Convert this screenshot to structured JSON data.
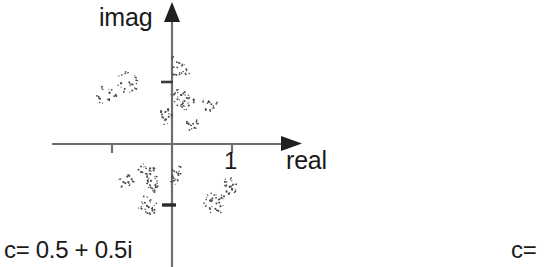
{
  "figure": {
    "title": "",
    "background_color": "#ffffff",
    "axis_color": "#6e6e6e",
    "point_color": "#4a4a4a",
    "text_color": "#1a1a1a"
  },
  "axes": {
    "x_axis_label": "real",
    "y_axis_label": "imag",
    "x_tick_labels": [
      "1"
    ],
    "origin_px": {
      "x": 172,
      "y": 144
    },
    "unit_px": 60,
    "x_ticks_value": [
      -1,
      1
    ],
    "y_ticks_value": [
      1,
      -1
    ],
    "x_range": [
      -2.0,
      2.0
    ],
    "y_range": [
      -2.0,
      2.4
    ]
  },
  "captions": {
    "left": "c= 0.5 + 0.5i",
    "right": "c="
  },
  "chart_data": {
    "type": "scatter",
    "title": "",
    "xlabel": "real",
    "ylabel": "imag",
    "xlim": [
      -2.0,
      2.0
    ],
    "ylim": [
      -2.0,
      2.4
    ],
    "grid": false,
    "legend": "none",
    "annotations": [
      "c= 0.5 + 0.5i",
      "c="
    ],
    "clusters": [
      {
        "name": "upper-left-outer",
        "center": [
          -1.07,
          0.85
        ],
        "n": 6
      },
      {
        "name": "upper-left-inner",
        "center": [
          -0.72,
          1.03
        ],
        "n": 11
      },
      {
        "name": "upper-right-top",
        "center": [
          0.12,
          1.25
        ],
        "n": 10
      },
      {
        "name": "upper-right-mid",
        "center": [
          0.18,
          0.72
        ],
        "n": 13
      },
      {
        "name": "upper-right-far",
        "center": [
          0.6,
          0.66
        ],
        "n": 6
      },
      {
        "name": "upper-axis-left",
        "center": [
          -0.1,
          0.5
        ],
        "n": 7
      },
      {
        "name": "upper-right-low",
        "center": [
          0.33,
          0.32
        ],
        "n": 6
      },
      {
        "name": "lower-left-upper",
        "center": [
          -0.42,
          -0.43
        ],
        "n": 7
      },
      {
        "name": "lower-left-mid",
        "center": [
          -0.78,
          -0.63
        ],
        "n": 6
      },
      {
        "name": "lower-left-inner",
        "center": [
          -0.32,
          -0.67
        ],
        "n": 11
      },
      {
        "name": "lower-axis-right",
        "center": [
          0.07,
          -0.53
        ],
        "n": 8
      },
      {
        "name": "lower-left-bottom",
        "center": [
          -0.4,
          -1.03
        ],
        "n": 10
      },
      {
        "name": "lower-right-main",
        "center": [
          0.72,
          -0.98
        ],
        "n": 13
      },
      {
        "name": "lower-right-upper",
        "center": [
          0.96,
          -0.72
        ],
        "n": 7
      }
    ],
    "points": [
      [
        -1.22,
        0.78
      ],
      [
        -1.14,
        0.92
      ],
      [
        -1.02,
        0.88
      ],
      [
        -1.06,
        0.74
      ],
      [
        -0.96,
        0.8
      ],
      [
        -1.18,
        0.66
      ],
      [
        -0.86,
        1.14
      ],
      [
        -0.76,
        1.18
      ],
      [
        -0.62,
        1.12
      ],
      [
        -0.82,
        1.02
      ],
      [
        -0.72,
        1.0
      ],
      [
        -0.66,
        0.96
      ],
      [
        -0.58,
        1.04
      ],
      [
        -0.78,
        0.9
      ],
      [
        -0.68,
        0.86
      ],
      [
        -0.88,
        0.96
      ],
      [
        -0.6,
        0.9
      ],
      [
        0.04,
        1.42
      ],
      [
        0.1,
        1.36
      ],
      [
        0.16,
        1.3
      ],
      [
        0.06,
        1.26
      ],
      [
        0.14,
        1.2
      ],
      [
        0.22,
        1.24
      ],
      [
        0.1,
        1.14
      ],
      [
        0.02,
        1.18
      ],
      [
        0.2,
        1.34
      ],
      [
        0.26,
        1.16
      ],
      [
        0.08,
        0.88
      ],
      [
        0.14,
        0.82
      ],
      [
        0.2,
        0.84
      ],
      [
        0.1,
        0.76
      ],
      [
        0.18,
        0.7
      ],
      [
        0.26,
        0.74
      ],
      [
        0.14,
        0.64
      ],
      [
        0.22,
        0.6
      ],
      [
        0.3,
        0.66
      ],
      [
        0.06,
        0.68
      ],
      [
        0.28,
        0.8
      ],
      [
        0.34,
        0.72
      ],
      [
        0.02,
        0.8
      ],
      [
        0.54,
        0.72
      ],
      [
        0.62,
        0.68
      ],
      [
        0.68,
        0.64
      ],
      [
        0.58,
        0.6
      ],
      [
        0.66,
        0.56
      ],
      [
        0.72,
        0.7
      ],
      [
        -0.16,
        0.56
      ],
      [
        -0.08,
        0.52
      ],
      [
        -0.02,
        0.46
      ],
      [
        -0.12,
        0.42
      ],
      [
        -0.18,
        0.48
      ],
      [
        -0.04,
        0.58
      ],
      [
        -0.1,
        0.36
      ],
      [
        0.26,
        0.36
      ],
      [
        0.34,
        0.32
      ],
      [
        0.4,
        0.28
      ],
      [
        0.3,
        0.24
      ],
      [
        0.38,
        0.38
      ],
      [
        0.44,
        0.34
      ],
      [
        -0.5,
        -0.36
      ],
      [
        -0.42,
        -0.4
      ],
      [
        -0.34,
        -0.44
      ],
      [
        -0.46,
        -0.48
      ],
      [
        -0.38,
        -0.52
      ],
      [
        -0.3,
        -0.38
      ],
      [
        -0.54,
        -0.44
      ],
      [
        -0.86,
        -0.58
      ],
      [
        -0.78,
        -0.62
      ],
      [
        -0.7,
        -0.66
      ],
      [
        -0.82,
        -0.7
      ],
      [
        -0.74,
        -0.54
      ],
      [
        -0.66,
        -0.6
      ],
      [
        -0.4,
        -0.6
      ],
      [
        -0.32,
        -0.64
      ],
      [
        -0.26,
        -0.68
      ],
      [
        -0.36,
        -0.72
      ],
      [
        -0.28,
        -0.56
      ],
      [
        -0.22,
        -0.62
      ],
      [
        -0.44,
        -0.66
      ],
      [
        -0.34,
        -0.76
      ],
      [
        -0.24,
        -0.74
      ],
      [
        -0.38,
        -0.54
      ],
      [
        -0.3,
        -0.8
      ],
      [
        0.04,
        -0.44
      ],
      [
        0.1,
        -0.48
      ],
      [
        0.02,
        -0.54
      ],
      [
        0.08,
        -0.58
      ],
      [
        0.14,
        -0.52
      ],
      [
        0.06,
        -0.64
      ],
      [
        0.12,
        -0.4
      ],
      [
        0.0,
        -0.6
      ],
      [
        -0.48,
        -0.98
      ],
      [
        -0.4,
        -1.02
      ],
      [
        -0.32,
        -1.06
      ],
      [
        -0.44,
        -1.1
      ],
      [
        -0.36,
        -0.94
      ],
      [
        -0.28,
        -1.0
      ],
      [
        -0.52,
        -1.06
      ],
      [
        -0.38,
        -1.14
      ],
      [
        -0.3,
        -1.12
      ],
      [
        -0.44,
        -0.9
      ],
      [
        0.6,
        -0.92
      ],
      [
        0.68,
        -0.96
      ],
      [
        0.76,
        -1.0
      ],
      [
        0.64,
        -1.04
      ],
      [
        0.72,
        -1.08
      ],
      [
        0.8,
        -0.94
      ],
      [
        0.56,
        -1.02
      ],
      [
        0.7,
        -0.88
      ],
      [
        0.84,
        -1.02
      ],
      [
        0.66,
        -1.12
      ],
      [
        0.78,
        -1.12
      ],
      [
        0.62,
        -0.84
      ],
      [
        0.86,
        -0.88
      ],
      [
        0.9,
        -0.7
      ],
      [
        0.98,
        -0.74
      ],
      [
        1.04,
        -0.68
      ],
      [
        0.94,
        -0.8
      ],
      [
        1.0,
        -0.6
      ],
      [
        0.88,
        -0.62
      ],
      [
        1.06,
        -0.78
      ]
    ]
  }
}
